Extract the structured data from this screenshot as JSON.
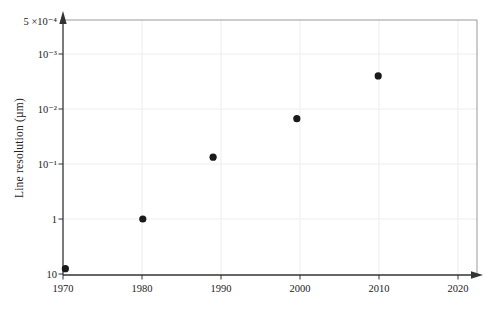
{
  "figure": {
    "background": "#ffffff"
  },
  "chart_data": {
    "type": "scatter",
    "title": "",
    "xlabel": "",
    "ylabel": "Line resolution (µm)",
    "x_axis": {
      "ticks": [
        1970,
        1980,
        1990,
        2000,
        2010,
        2020
      ],
      "range_years": [
        1970,
        2022.5
      ],
      "arrow": "right"
    },
    "y_axis": {
      "scale": "log-inverted",
      "top_label": "5 ×10⁻⁴",
      "top_value": 0.0005,
      "bottom_value": 10,
      "ticks": [
        {
          "label": "10⁻³",
          "value": 0.001
        },
        {
          "label": "10⁻²",
          "value": 0.01
        },
        {
          "label": "10⁻¹",
          "value": 0.1
        },
        {
          "label": "1",
          "value": 1
        },
        {
          "label": "10",
          "value": 10
        }
      ],
      "arrow": "up"
    },
    "points": [
      {
        "year": 1970.3,
        "value": 8
      },
      {
        "year": 1980.1,
        "value": 1.0
      },
      {
        "year": 1989.0,
        "value": 0.075
      },
      {
        "year": 1999.6,
        "value": 0.015
      },
      {
        "year": 2009.9,
        "value": 0.0025
      }
    ],
    "grid": true,
    "legend": "none",
    "marker": {
      "shape": "circle",
      "color": "#1a1a1a",
      "radius_px": 3.6
    },
    "colors": {
      "axis": "#333333",
      "frame": "#999999",
      "gridline": "#ededed",
      "text": "#222222"
    }
  }
}
